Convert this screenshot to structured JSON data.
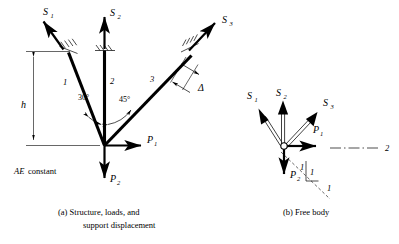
{
  "figure": {
    "title_a": "(a) Structure, loads, and",
    "title_a2": "support displacement",
    "title_b": "(b) Free body",
    "note_material": "AE",
    "note_material_rest": " constant"
  },
  "structure": {
    "member_labels": [
      "1",
      "2",
      "3"
    ],
    "angles": [
      "30°",
      "45°"
    ],
    "height_label": "h",
    "displacement_label": "Δ",
    "support_forces": [
      {
        "name": "S",
        "sub": "1"
      },
      {
        "name": "S",
        "sub": "2"
      },
      {
        "name": "S",
        "sub": "3"
      }
    ],
    "loads": [
      {
        "name": "P",
        "sub": "1"
      },
      {
        "name": "P",
        "sub": "2"
      }
    ]
  },
  "free_body": {
    "forces": [
      {
        "name": "S",
        "sub": "1"
      },
      {
        "name": "S",
        "sub": "2"
      },
      {
        "name": "S",
        "sub": "3"
      }
    ],
    "loads": [
      {
        "name": "P",
        "sub": "1"
      },
      {
        "name": "P",
        "sub": "2"
      }
    ],
    "axis_label": "2",
    "slope_rise": "1",
    "slope_run": "1",
    "slope_tick": "1"
  },
  "colors": {
    "ink": "#000000",
    "paper": "#ffffff"
  }
}
